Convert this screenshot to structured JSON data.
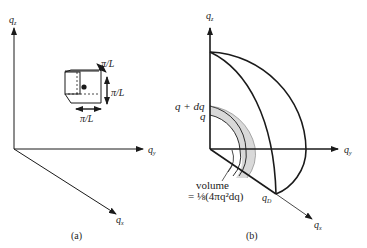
{
  "panel_a": {
    "caption": "(a)",
    "axes": {
      "qz": "q",
      "qz_sub": "z",
      "qy": "q",
      "qy_sub": "y",
      "qx": "q",
      "qx_sub": "x"
    },
    "cube_labels": {
      "depth": "π/L",
      "height": "π/L",
      "width": "π/L"
    }
  },
  "panel_b": {
    "caption": "(b)",
    "axes": {
      "qz": "q",
      "qz_sub": "z",
      "qy": "q",
      "qy_sub": "y",
      "qx": "q",
      "qx_sub": "x"
    },
    "shell_labels": {
      "outer": "q + dq",
      "inner": "q"
    },
    "volume_label_line1": "volume",
    "volume_label_line2": "= ⅛(4πq²dq)",
    "debye_label": "q",
    "debye_sub": "D"
  },
  "colors": {
    "ink": "#1a1a1a",
    "shell_fill": "#d9d9d9",
    "background": "#ffffff"
  }
}
